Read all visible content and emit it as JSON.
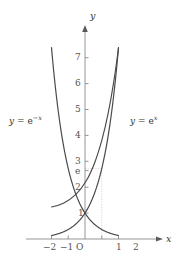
{
  "figure": {
    "background_color": "#ffffff",
    "curve_color": "#4a4a4a",
    "axis_color": "#7d7d7d",
    "guide_color": "#c9c9c9",
    "text_color": "#3a3a3a"
  },
  "axes": {
    "x_axis_name": "x",
    "y_axis_name": "y",
    "origin_label": "O",
    "x_tick_labels": [
      "−2",
      "−1",
      "0",
      "1",
      "2"
    ],
    "y_tick_labels": [
      "1",
      "2",
      "3",
      "4",
      "5",
      "6",
      "7"
    ],
    "special_y_tick": "e"
  },
  "labels": {
    "left_curve": {
      "lhs": "y",
      "eq": "=",
      "base": "e",
      "exponent": "−x"
    },
    "right_curve": {
      "lhs": "y",
      "eq": "=",
      "base": "e",
      "exponent": "x"
    }
  },
  "chart_data": {
    "type": "line",
    "title": "",
    "xlabel": "x",
    "ylabel": "y",
    "xlim": [
      -2.25,
      2.25
    ],
    "ylim": [
      -0.3,
      7.7
    ],
    "xticks": [
      -2,
      -1,
      0,
      1,
      2
    ],
    "yticks": [
      1,
      2,
      3,
      4,
      5,
      6,
      7
    ],
    "annotated_y_value": 2.718,
    "annotated_y_label": "e",
    "grid": false,
    "legend": "inline-curve-labels",
    "guides": [
      {
        "kind": "horizontal-dotted",
        "y": 2.718,
        "from_x": 0,
        "to_x": 1
      },
      {
        "kind": "vertical-dotted",
        "x": 1,
        "from_y": 0,
        "to_y": 2.718
      }
    ],
    "series": [
      {
        "name": "y = e^x",
        "label": "y = e^x",
        "color": "#4a4a4a",
        "x": [
          -2,
          -1.75,
          -1.5,
          -1.25,
          -1,
          -0.75,
          -0.5,
          -0.25,
          0,
          0.25,
          0.5,
          0.75,
          1,
          1.25,
          1.5,
          1.75,
          2
        ],
        "values": [
          0.135,
          0.174,
          0.223,
          0.287,
          0.368,
          0.472,
          0.607,
          0.779,
          1.0,
          1.284,
          1.649,
          2.117,
          2.718,
          3.49,
          4.482,
          5.755,
          7.389
        ]
      },
      {
        "name": "y = e^-x",
        "label": "y = e^{-x}",
        "color": "#4a4a4a",
        "x": [
          -2,
          -1.75,
          -1.5,
          -1.25,
          -1,
          -0.75,
          -0.5,
          -0.25,
          0,
          0.25,
          0.5,
          0.75,
          1,
          1.25,
          1.5,
          1.75,
          2
        ],
        "values": [
          7.389,
          5.755,
          4.482,
          3.49,
          2.718,
          2.117,
          1.649,
          1.284,
          1.0,
          0.779,
          0.607,
          0.472,
          0.368,
          0.287,
          0.223,
          0.174,
          0.135
        ]
      }
    ],
    "intersection": {
      "x": 0,
      "y": 1
    }
  }
}
